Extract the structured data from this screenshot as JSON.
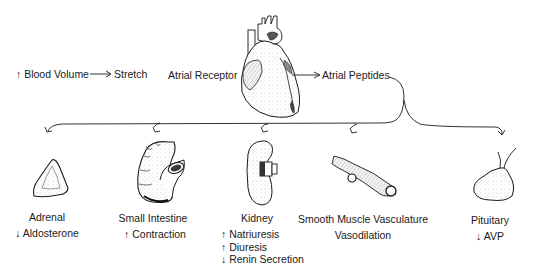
{
  "flow": {
    "blood_volume": "↑ Blood Volume",
    "stretch": "Stretch",
    "atrial_receptor": "Atrial Receptor",
    "atrial_peptides": "Atrial Peptides"
  },
  "targets": [
    {
      "organ": "Adrenal",
      "effects": [
        "↓ Aldosterone"
      ],
      "icon": "adrenal-gland-icon"
    },
    {
      "organ": "Small Intestine",
      "effects": [
        "↑ Contraction"
      ],
      "icon": "small-intestine-icon"
    },
    {
      "organ": "Kidney",
      "effects": [
        "↑ Natriuresis",
        "↑ Diuresis",
        "↓ Renin Secretion"
      ],
      "icon": "kidney-icon"
    },
    {
      "organ": "Smooth Muscle Vasculature",
      "effects": [
        "Vasodilation"
      ],
      "icon": "blood-vessel-icon"
    },
    {
      "organ": "Pituitary",
      "effects": [
        "↓ AVP"
      ],
      "icon": "pituitary-gland-icon"
    }
  ],
  "colors": {
    "ink": "#1a1a1a",
    "shade": "#cfcfcf",
    "background": "#ffffff"
  }
}
